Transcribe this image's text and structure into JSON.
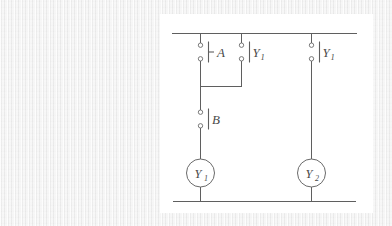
{
  "figure": {
    "kind": "ladder-logic-relay-diagram",
    "background_color": "#ececec",
    "panel_color": "#ffffff",
    "line_color": "#5f5f5f",
    "rails": {
      "top_label": "top-power-rail",
      "bottom_label": "bottom-power-rail"
    },
    "contacts": [
      {
        "id": "contact-a",
        "label": "A",
        "subscript": "",
        "type": "normally-open",
        "branch": "left",
        "label_side": "right"
      },
      {
        "id": "contact-y1-seal",
        "label": "Y",
        "subscript": "1",
        "type": "normally-open",
        "branch": "middle",
        "label_side": "right"
      },
      {
        "id": "contact-b",
        "label": "B",
        "subscript": "",
        "type": "normally-open",
        "branch": "left",
        "label_side": "right"
      },
      {
        "id": "contact-y1-right",
        "label": "Y",
        "subscript": "1",
        "type": "normally-open",
        "branch": "right",
        "label_side": "right"
      }
    ],
    "coils": [
      {
        "id": "coil-y1",
        "label": "Y",
        "subscript": "1",
        "branch": "left"
      },
      {
        "id": "coil-y2",
        "label": "Y",
        "subscript": "2",
        "branch": "right"
      }
    ]
  }
}
